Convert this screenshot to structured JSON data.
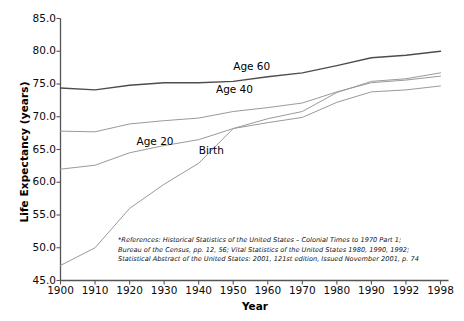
{
  "chart_data": {
    "type": "line",
    "title": "",
    "xlabel": "Year",
    "ylabel": "Life Expectancy (years)",
    "categories": [
      "1900",
      "1910",
      "1920",
      "1930",
      "1940",
      "1950",
      "1960",
      "1970",
      "1980",
      "1990",
      "1992",
      "1998"
    ],
    "x": [
      1900,
      1910,
      1920,
      1930,
      1940,
      1950,
      1960,
      1970,
      1980,
      1990,
      1992,
      1998
    ],
    "ylim": [
      45.0,
      85.0
    ],
    "ytick_labels": [
      "45.0",
      "50.0",
      "55.0",
      "60.0",
      "65.0",
      "70.0",
      "75.0",
      "80.0",
      "85.0"
    ],
    "ytick_values": [
      45.0,
      50.0,
      55.0,
      60.0,
      65.0,
      70.0,
      75.0,
      80.0,
      85.0
    ],
    "grid": false,
    "legend_position": "inline-annotations",
    "series": [
      {
        "name": "Age 60",
        "color": "#4d4d4d",
        "values": [
          74.4,
          74.1,
          74.8,
          75.2,
          75.2,
          75.4,
          76.1,
          76.7,
          77.8,
          79.0,
          79.4,
          80.0
        ]
      },
      {
        "name": "Age 40",
        "color": "#9a9a9a",
        "values": [
          67.8,
          67.7,
          68.9,
          69.4,
          69.8,
          70.8,
          71.4,
          72.1,
          73.8,
          75.2,
          75.6,
          76.2
        ]
      },
      {
        "name": "Age 20",
        "color": "#9a9a9a",
        "values": [
          62.0,
          62.6,
          64.5,
          65.6,
          66.5,
          68.2,
          69.1,
          69.9,
          72.2,
          73.8,
          74.1,
          74.7
        ]
      },
      {
        "name": "Birth",
        "color": "#9a9a9a",
        "values": [
          47.3,
          50.0,
          56.0,
          59.7,
          62.9,
          68.2,
          69.7,
          70.8,
          73.7,
          75.4,
          75.8,
          76.7
        ]
      }
    ],
    "annotations": [
      {
        "text": "Age 60",
        "x_category": "1950",
        "y_value": 77.6
      },
      {
        "text": "Age 40",
        "x_category": "1945",
        "y_value": 74.1
      },
      {
        "text": "Age 20",
        "x_category": "1922",
        "y_value": 66.1
      },
      {
        "text": "Birth",
        "x_category": "1940",
        "y_value": 64.7
      }
    ]
  },
  "footnote": {
    "line1": "*References: Historical Statistics of the United States – Colonial Times to 1970 Part 1;",
    "line2": "Bureau of the Census, pp. 12, 56; Vital Statistics of the United States 1980, 1990, 1992;",
    "line3": "Statistical Abstract of the United States: 2001, 121st edition, Issued November 2001, p. 74"
  }
}
